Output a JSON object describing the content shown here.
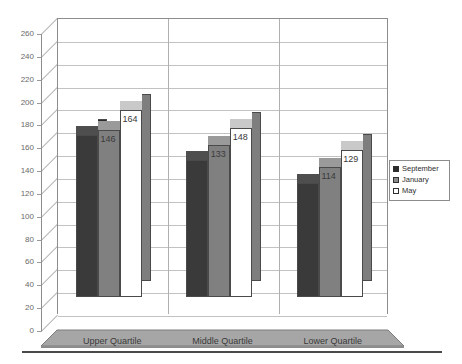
{
  "chart_data": {
    "type": "bar",
    "title": "",
    "subtitle": "",
    "xlabel": "",
    "ylabel": "",
    "categories": [
      "Upper Quartile",
      "Middle Quartile",
      "Lower Quartile"
    ],
    "series": [
      {
        "name": "September",
        "values": [
          142,
          120,
          100
        ],
        "color": "#3a3a3a"
      },
      {
        "name": "January",
        "values": [
          146,
          133,
          114
        ],
        "color": "#808080"
      },
      {
        "name": "May",
        "values": [
          164,
          148,
          129
        ],
        "color": "#ffffff"
      }
    ],
    "ylim": [
      0,
      260
    ],
    "ytick_step": 20,
    "yticks": [
      0,
      20,
      40,
      60,
      80,
      100,
      120,
      140,
      160,
      180,
      200,
      220,
      240,
      260
    ],
    "ytick_labels": [
      "0",
      "20",
      "40",
      "60",
      "80",
      "100",
      "120",
      "140",
      "160",
      "180",
      "200",
      "220",
      "240",
      "260"
    ],
    "grid": true,
    "grid_axis": "y",
    "legend_position": "right",
    "three_d": true,
    "data_labels": true,
    "data_labels_values": [
      [
        "142",
        "146",
        "164"
      ],
      [
        "120",
        "133",
        "148"
      ],
      [
        "100",
        "114",
        "129"
      ]
    ]
  },
  "legend": {
    "entries": [
      {
        "label": "September",
        "swatch": "black-square-swatch"
      },
      {
        "label": "January",
        "swatch": "gray-square-swatch"
      },
      {
        "label": "May",
        "swatch": "white-square-swatch"
      }
    ]
  },
  "colors": {
    "september": "#3a3a3a",
    "january": "#808080",
    "may": "#ffffff",
    "grid": "#c2c2c2",
    "axis": "#8d8d8d",
    "floor": "#9a9a9a",
    "text": "#3a3a3a"
  }
}
